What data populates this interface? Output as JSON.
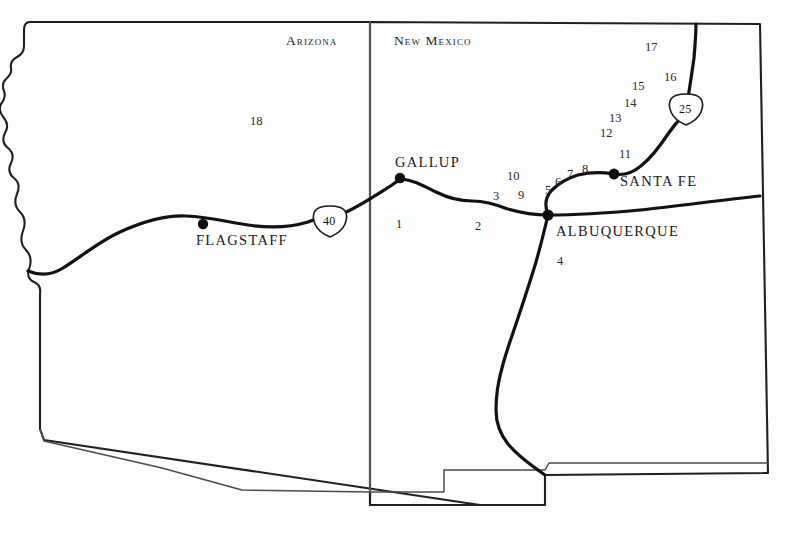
{
  "map": {
    "title": "Arizona and New Mexico reference map",
    "background_color": "#fdfdfd",
    "outline_color": "#1a1a20",
    "road_color": "#111118",
    "state_border_color": "#6a6a72",
    "states": [
      {
        "name": "Arizona",
        "label": "Arizona",
        "x": 286,
        "y": 41
      },
      {
        "name": "New Mexico",
        "label": "New Mexico",
        "x": 394,
        "y": 41
      }
    ],
    "cities": [
      {
        "name": "Flagstaff",
        "label": "FLAGSTAFF",
        "label_x": 196,
        "label_y": 240,
        "dot_x": 203,
        "dot_y": 224
      },
      {
        "name": "Gallup",
        "label": "GALLUP",
        "label_x": 395,
        "label_y": 163,
        "dot_x": 400,
        "dot_y": 178
      },
      {
        "name": "Albuquerque",
        "label": "ALBUQUERQUE",
        "label_x": 556,
        "label_y": 231,
        "dot_x": 548,
        "dot_y": 215
      },
      {
        "name": "Santa Fe",
        "label": "SANTA FE",
        "label_x": 620,
        "label_y": 181,
        "dot_x": 614,
        "dot_y": 174
      }
    ],
    "highways": [
      {
        "name": "Interstate 40",
        "shield_label": "40",
        "shield_x": 330,
        "shield_y": 221
      },
      {
        "name": "Interstate 25",
        "shield_label": "25",
        "shield_x": 686,
        "shield_y": 109
      }
    ],
    "site_numbers": [
      {
        "label": "1",
        "x": 399,
        "y": 224
      },
      {
        "label": "2",
        "x": 478,
        "y": 226
      },
      {
        "label": "3",
        "x": 496,
        "y": 196
      },
      {
        "label": "4",
        "x": 560,
        "y": 261
      },
      {
        "label": "5",
        "x": 548,
        "y": 190
      },
      {
        "label": "6",
        "x": 558,
        "y": 182
      },
      {
        "label": "7",
        "x": 570,
        "y": 174
      },
      {
        "label": "8",
        "x": 585,
        "y": 169
      },
      {
        "label": "9",
        "x": 521,
        "y": 195
      },
      {
        "label": "10",
        "x": 512,
        "y": 176
      },
      {
        "label": "11",
        "x": 623,
        "y": 154
      },
      {
        "label": "12",
        "x": 604,
        "y": 133
      },
      {
        "label": "13",
        "x": 613,
        "y": 118
      },
      {
        "label": "14",
        "x": 628,
        "y": 103
      },
      {
        "label": "15",
        "x": 636,
        "y": 86
      },
      {
        "label": "16",
        "x": 668,
        "y": 77
      },
      {
        "label": "17",
        "x": 649,
        "y": 47
      },
      {
        "label": "18",
        "x": 253,
        "y": 121
      }
    ]
  }
}
